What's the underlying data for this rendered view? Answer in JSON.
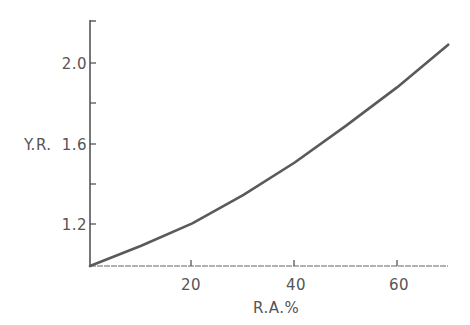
{
  "chart_data": {
    "type": "line",
    "title": "",
    "xlabel": "R.A.%",
    "ylabel": "Y.R.",
    "xlim": [
      0,
      70
    ],
    "ylim": [
      1.0,
      2.2
    ],
    "x_ticks": [
      20,
      40,
      60
    ],
    "x_tick_labels": [
      "20",
      "40",
      "60"
    ],
    "y_ticks": [
      1.2,
      1.6,
      2.0
    ],
    "y_tick_labels": [
      "1.2",
      "1.6",
      "2.0"
    ],
    "y_minor_ticks": [
      1.4,
      1.8,
      2.2
    ],
    "grid": false,
    "legend": null,
    "series": [
      {
        "name": "Y.R.",
        "x": [
          0,
          10,
          20,
          30,
          40,
          50,
          60,
          70
        ],
        "y": [
          1.0,
          1.1,
          1.21,
          1.35,
          1.51,
          1.69,
          1.88,
          2.09
        ]
      }
    ]
  },
  "axes": {
    "x_label": "R.A.%",
    "y_label": "Y.R.",
    "x_tick_labels": [
      "20",
      "40",
      "60"
    ],
    "y_tick_labels": [
      "1.2",
      "1.6",
      "2.0"
    ]
  },
  "colors": {
    "ink": "#555555",
    "line": "#5a5a5a"
  }
}
